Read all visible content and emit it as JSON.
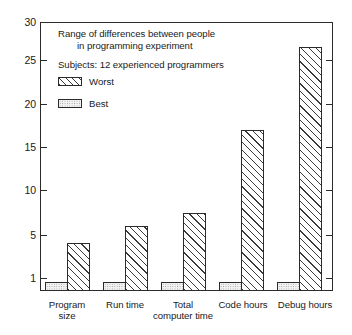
{
  "chart_data": {
    "type": "bar",
    "title": "",
    "annotations": [
      "Range of differences between people",
      "in programming experiment",
      "Subjects:  12 experienced programmers"
    ],
    "caption_line_1": "Range of differences between people",
    "caption_line_2": "in programming experiment",
    "caption_line_3": "Subjects:  12 experienced programmers",
    "categories": [
      "Program size",
      "Run time",
      "Total computer time",
      "Code hours",
      "Debug hours"
    ],
    "category_labels": [
      {
        "line1": "Program",
        "line2": "size"
      },
      {
        "line1": "Run time",
        "line2": ""
      },
      {
        "line1": "Total",
        "line2": "computer time"
      },
      {
        "line1": "Code hours",
        "line2": ""
      },
      {
        "line1": "Debug hours",
        "line2": ""
      }
    ],
    "series": [
      {
        "name": "Best",
        "values": [
          1,
          1,
          1,
          1,
          1
        ]
      },
      {
        "name": "Worst",
        "values": [
          5.3,
          7.2,
          8.7,
          18,
          27.2
        ]
      }
    ],
    "legend": [
      {
        "name": "Worst",
        "pattern": "diagonal-hatch"
      },
      {
        "name": "Best",
        "pattern": "stipple"
      }
    ],
    "legend_position": "inside-upper-left",
    "xlabel": "",
    "ylabel": "",
    "ylim": [
      0,
      30
    ],
    "yticks": [
      1,
      5,
      10,
      15,
      20,
      25,
      30
    ],
    "ytick_labels": [
      "1",
      "5",
      "10",
      "15",
      "20",
      "25",
      "30"
    ],
    "grid": false,
    "axis_color": "#2b2b2b",
    "bar_fill_worst": "#ffffff",
    "bar_fill_best": "#f2f2f2"
  }
}
